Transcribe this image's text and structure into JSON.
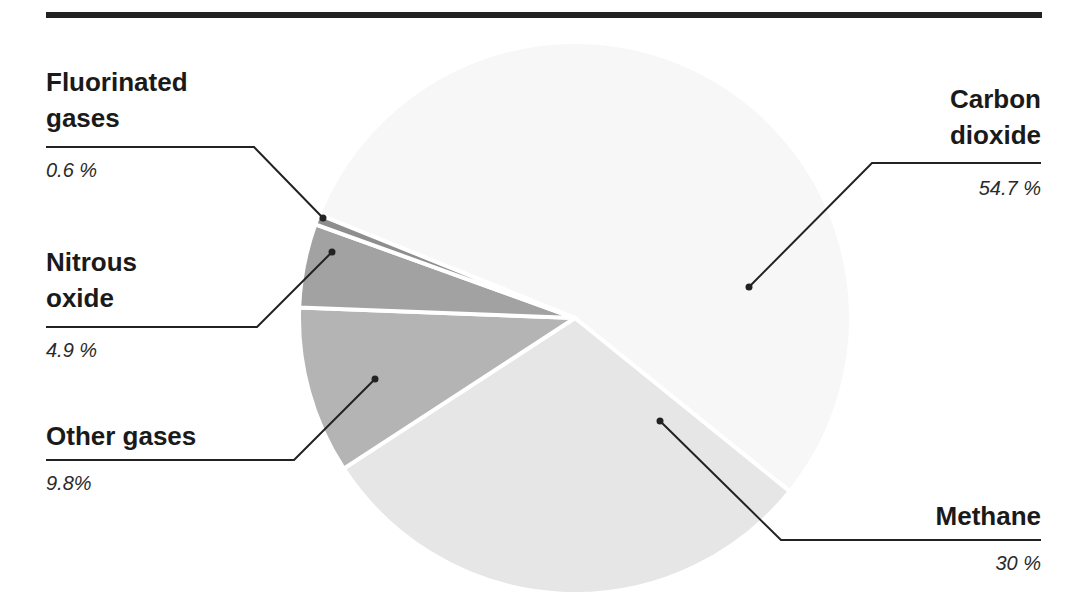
{
  "chart_data": {
    "type": "pie",
    "title": "",
    "categories": [
      "Carbon dioxide",
      "Methane",
      "Other gases",
      "Nitrous oxide",
      "Fluorinated gases"
    ],
    "values": [
      54.7,
      30,
      9.8,
      4.9,
      0.6
    ],
    "value_labels": [
      "54.7 %",
      "30 %",
      "9.8%",
      "4.9 %",
      "0.6 %"
    ],
    "colors": [
      "#f7f7f7",
      "#e6e6e6",
      "#b4b4b4",
      "#a2a2a2",
      "#8e8e8e"
    ],
    "start_angle_deg": 292,
    "direction": "clockwise",
    "legend": "callout labels",
    "center": [
      575,
      318
    ],
    "radius": 276
  },
  "labels": {
    "fluorinated": {
      "name_line1": "Fluorinated",
      "name_line2": "gases",
      "value": "0.6 %"
    },
    "nitrous": {
      "name_line1": "Nitrous",
      "name_line2": "oxide",
      "value": "4.9 %"
    },
    "other": {
      "name_line1": "Other gases",
      "value": "9.8%"
    },
    "co2": {
      "name_line1": "Carbon",
      "name_line2": "dioxide",
      "value": "54.7 %"
    },
    "methane": {
      "name_line1": "Methane",
      "value": "30 %"
    }
  },
  "colors": {
    "rule": "#222222",
    "text": "#1a1a1a",
    "leader": "#222222"
  }
}
